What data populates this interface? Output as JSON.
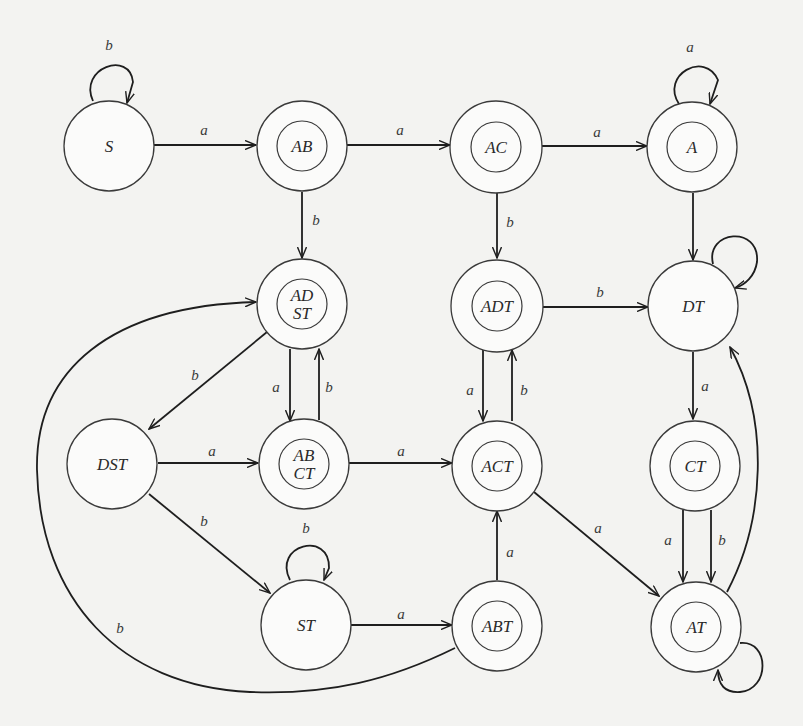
{
  "diagram": {
    "type": "state-diagram",
    "nodes": [
      {
        "id": "S",
        "label_lines": [
          "S"
        ],
        "x": 109,
        "y": 131,
        "accepting": false
      },
      {
        "id": "AB",
        "label_lines": [
          "AB"
        ],
        "x": 301,
        "y": 131,
        "accepting": true
      },
      {
        "id": "AC",
        "label_lines": [
          "AC"
        ],
        "x": 495,
        "y": 131,
        "accepting": true
      },
      {
        "id": "A",
        "label_lines": [
          "A"
        ],
        "x": 692,
        "y": 131,
        "accepting": true
      },
      {
        "id": "ADST",
        "label_lines": [
          "AD",
          "ST"
        ],
        "x": 301,
        "y": 307,
        "accepting": true
      },
      {
        "id": "ADT",
        "label_lines": [
          "ADT"
        ],
        "x": 497,
        "y": 307,
        "accepting": true
      },
      {
        "id": "DT",
        "label_lines": [
          "DT"
        ],
        "x": 693,
        "y": 307,
        "accepting": false
      },
      {
        "id": "DST",
        "label_lines": [
          "DST"
        ],
        "x": 114,
        "y": 466,
        "accepting": false
      },
      {
        "id": "ABCT",
        "label_lines": [
          "AB",
          "CT"
        ],
        "x": 303,
        "y": 466,
        "accepting": true
      },
      {
        "id": "ACT",
        "label_lines": [
          "ACT"
        ],
        "x": 497,
        "y": 466,
        "accepting": true
      },
      {
        "id": "CT",
        "label_lines": [
          "CT"
        ],
        "x": 695,
        "y": 466,
        "accepting": true
      },
      {
        "id": "ST",
        "label_lines": [
          "ST"
        ],
        "x": 306,
        "y": 625,
        "accepting": false
      },
      {
        "id": "ABT",
        "label_lines": [
          "ABT"
        ],
        "x": 497,
        "y": 625,
        "accepting": true
      },
      {
        "id": "AT",
        "label_lines": [
          "AT"
        ],
        "x": 695,
        "y": 625,
        "accepting": true
      }
    ],
    "edges": [
      {
        "from": "S",
        "to": "S",
        "label": "b"
      },
      {
        "from": "S",
        "to": "AB",
        "label": "a"
      },
      {
        "from": "AB",
        "to": "AC",
        "label": "a"
      },
      {
        "from": "AC",
        "to": "A",
        "label": "a"
      },
      {
        "from": "A",
        "to": "A",
        "label": "a"
      },
      {
        "from": "AB",
        "to": "ADST",
        "label": "b"
      },
      {
        "from": "AC",
        "to": "ADT",
        "label": "b"
      },
      {
        "from": "A",
        "to": "DT",
        "label": ""
      },
      {
        "from": "ADT",
        "to": "DT",
        "label": "b"
      },
      {
        "from": "DT",
        "to": "DT",
        "label": ""
      },
      {
        "from": "ADST",
        "to": "DST",
        "label": "b"
      },
      {
        "from": "ADST",
        "to": "ABCT",
        "label": "a"
      },
      {
        "from": "ABCT",
        "to": "ADST",
        "label": "b"
      },
      {
        "from": "ADT",
        "to": "ACT",
        "label": "a"
      },
      {
        "from": "ACT",
        "to": "ADT",
        "label": "b"
      },
      {
        "from": "DST",
        "to": "ABCT",
        "label": "a"
      },
      {
        "from": "ABCT",
        "to": "ACT",
        "label": "a"
      },
      {
        "from": "DT",
        "to": "CT",
        "label": "a"
      },
      {
        "from": "DST",
        "to": "ST",
        "label": "b"
      },
      {
        "from": "ST",
        "to": "ST",
        "label": "b"
      },
      {
        "from": "ST",
        "to": "ABT",
        "label": "a"
      },
      {
        "from": "ABT",
        "to": "ACT",
        "label": "a"
      },
      {
        "from": "ACT",
        "to": "AT",
        "label": "a"
      },
      {
        "from": "CT",
        "to": "AT",
        "label": "a"
      },
      {
        "from": "CT",
        "to": "AT",
        "label": "b"
      },
      {
        "from": "AT",
        "to": "DT",
        "label": ""
      },
      {
        "from": "AT",
        "to": "AT",
        "label": ""
      },
      {
        "from": "ABT",
        "to": "ADST",
        "label": "b"
      }
    ]
  },
  "labels": {
    "S": "S",
    "AB": "AB",
    "AC": "AC",
    "A": "A",
    "ADST_1": "AD",
    "ADST_2": "ST",
    "ADT": "ADT",
    "DT": "DT",
    "DST": "DST",
    "ABCT_1": "AB",
    "ABCT_2": "CT",
    "ACT": "ACT",
    "CT": "CT",
    "ST": "ST",
    "ABT": "ABT",
    "AT": "AT"
  },
  "edge_labels": {
    "S_S": "b",
    "S_AB": "a",
    "AB_AC": "a",
    "AC_A": "a",
    "A_A": "a",
    "AB_ADST": "b",
    "AC_ADT": "b",
    "ADT_DT": "b",
    "ADST_DST": "b",
    "ADST_ABCT": "a",
    "ABCT_ADST": "b",
    "ADT_ACT": "a",
    "ACT_ADT": "b",
    "DST_ABCT": "a",
    "ABCT_ACT": "a",
    "DT_CT": "a",
    "DST_ST": "b",
    "ST_ST": "b",
    "ST_ABT": "a",
    "ABT_ACT": "a",
    "ACT_AT": "a",
    "CT_AT_a": "a",
    "CT_AT_b": "b",
    "ABT_ADST": "b"
  }
}
